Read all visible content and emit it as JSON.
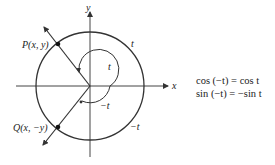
{
  "diagram": {
    "type": "unit-circle-symmetry",
    "colors": {
      "stroke": "#333333",
      "text": "#222222",
      "background": "#ffffff"
    },
    "axes": {
      "x_label": "x",
      "y_label": "y"
    },
    "points": {
      "P": {
        "label": "P(x, y)"
      },
      "Q": {
        "label": "Q(x, −y)"
      }
    },
    "arc_labels": {
      "outer_top": "t",
      "outer_bottom": "−t",
      "inner_top": "t",
      "inner_bottom": "−t"
    },
    "formulas": [
      "cos (−t) = cos t",
      "sin (−t) = −sin t"
    ]
  }
}
